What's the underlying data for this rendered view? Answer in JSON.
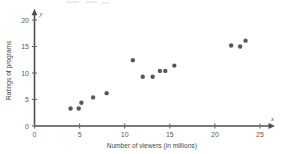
{
  "chart_data": {
    "type": "scatter",
    "title": "",
    "xlabel": "Number of viewers (in millions)",
    "ylabel": "Ratings of programs",
    "x_axis_variable": "x",
    "y_axis_variable": "y",
    "xlim": [
      0,
      26
    ],
    "ylim": [
      0,
      21
    ],
    "xticks": [
      0,
      5,
      10,
      15,
      20,
      25
    ],
    "yticks": [
      0,
      5,
      10,
      15,
      20
    ],
    "xtick_labels": [
      "0",
      "5",
      "10",
      "15",
      "20",
      "25"
    ],
    "ytick_labels": [
      "0",
      "5",
      "10",
      "15",
      "20"
    ],
    "grid": false,
    "legend": null,
    "marker": "filled-circle",
    "marker_color": "#59595c",
    "axis_color": "#4d4d4d",
    "points": [
      {
        "x": 4.0,
        "y": 3.3
      },
      {
        "x": 4.9,
        "y": 3.3
      },
      {
        "x": 5.2,
        "y": 4.4
      },
      {
        "x": 6.5,
        "y": 5.4
      },
      {
        "x": 8.0,
        "y": 6.2
      },
      {
        "x": 10.9,
        "y": 12.4
      },
      {
        "x": 12.0,
        "y": 9.3
      },
      {
        "x": 13.1,
        "y": 9.3
      },
      {
        "x": 13.9,
        "y": 10.4
      },
      {
        "x": 14.5,
        "y": 10.4
      },
      {
        "x": 15.5,
        "y": 11.4
      },
      {
        "x": 21.8,
        "y": 15.2
      },
      {
        "x": 22.8,
        "y": 15.0
      },
      {
        "x": 23.4,
        "y": 16.1
      }
    ]
  },
  "figure": {
    "background_color": "#ffffff"
  }
}
